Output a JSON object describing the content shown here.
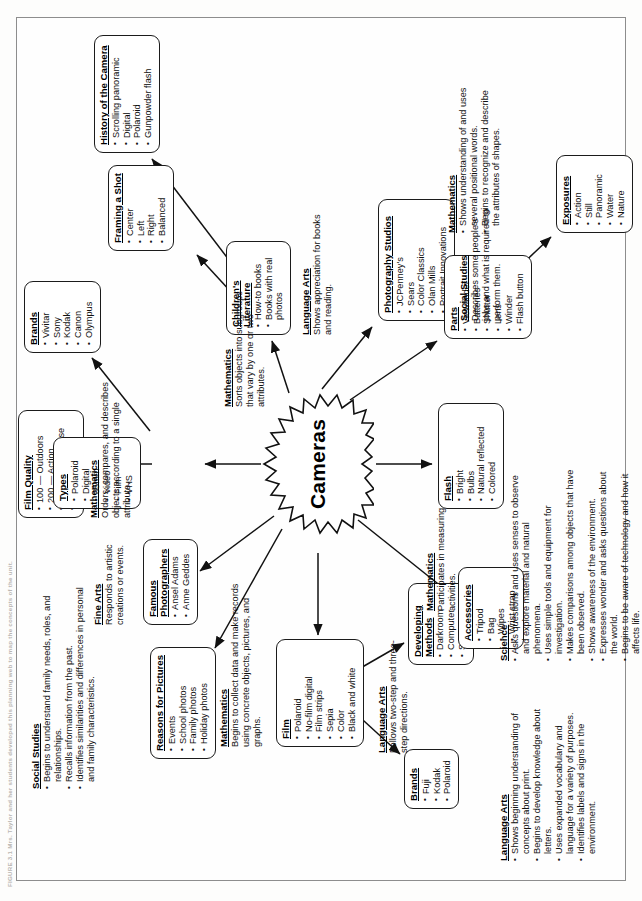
{
  "figure": {
    "caption": "FIGURE 3.1   Mrs. Taylor and her students developed this planning web to map the concepts of the unit."
  },
  "hub": {
    "label": "Cameras"
  },
  "nodes": [
    {
      "id": "reasons-for-pictures",
      "title": "Reasons for Pictures",
      "items": [
        "Events",
        "School photos",
        "Family photos",
        "Holiday photos"
      ]
    },
    {
      "id": "famous-photographers",
      "title": "Famous Photographers",
      "items": [
        "Ansel Adams",
        "Anne Geddes"
      ]
    },
    {
      "id": "film-quality",
      "title": "Film Quality",
      "items": [
        "100 — Outdoors",
        "200 — Action",
        "400 — All purpose",
        "800 — Lowest"
      ]
    },
    {
      "id": "types",
      "title": "Types",
      "items": [
        "Polaroid",
        "Digital",
        "35mm",
        "Video",
        "Film",
        "VHS"
      ]
    },
    {
      "id": "brands-camera",
      "title": "Brands",
      "items": [
        "Vivitar",
        "Sony",
        "Kodak",
        "Canon",
        "Olympus"
      ]
    },
    {
      "id": "framing-a-shot",
      "title": "Framing a Shot",
      "items": [
        "Center",
        "Left",
        "Right",
        "Balanced"
      ]
    },
    {
      "id": "history-of-the-camera",
      "title": "History of the Camera",
      "items": [
        "Scrolling panoramic",
        "Digital",
        "Polaroid",
        "Gunpowder flash"
      ]
    },
    {
      "id": "childrens-literature",
      "title": "Children's Literature",
      "items": [
        "How-to books",
        "Books with real photos"
      ]
    },
    {
      "id": "photography-studios",
      "title": "Photography Studios",
      "items": [
        "JCPenney's",
        "Sears",
        "Color Classics",
        "Olan Mills",
        "Portrait Innovations"
      ]
    },
    {
      "id": "film",
      "title": "Film",
      "items": [
        "Polaroid",
        "No-film digital",
        "Film strips",
        "Sepia",
        "Color",
        "Black and white"
      ]
    },
    {
      "id": "brands-film",
      "title": "Brands",
      "items": [
        "Fuji",
        "Kodak",
        "Polaroid"
      ]
    },
    {
      "id": "developing-methods",
      "title": "Developing Methods",
      "items": [
        "Darkroom",
        "Computer",
        "Store"
      ]
    },
    {
      "id": "accessories",
      "title": "Accessories",
      "items": [
        "Tripod",
        "Bag",
        "Wipes",
        "Wrist strap"
      ]
    },
    {
      "id": "flash",
      "title": "Flash",
      "items": [
        "Bright",
        "Bulbs",
        "Natural reflected",
        "Colored"
      ]
    },
    {
      "id": "parts",
      "title": "Parts",
      "items": [
        "Viewfinder",
        "Batteries",
        "Shutter",
        "Lens",
        "Winder",
        "Flash button"
      ]
    },
    {
      "id": "exposures",
      "title": "Exposures",
      "items": [
        "Action",
        "Still",
        "Panoramic",
        "Water",
        "Nature"
      ]
    }
  ],
  "standards": [
    {
      "id": "social-studies-family",
      "heading": "Social Studies",
      "bullets": [
        "Begins to understand family needs, roles, and relationships.",
        "Recalls information from the past.",
        "Identifies similarities and differences in personal and family characteristics."
      ],
      "body": ""
    },
    {
      "id": "fine-arts",
      "heading": "Fine Arts",
      "bullets": [],
      "body": "Responds to artistic creations or events."
    },
    {
      "id": "mathematics-orders",
      "heading": "Mathematics",
      "bullets": [],
      "body": "Orders, compares, and describes objects according to a single attribute."
    },
    {
      "id": "mathematics-sorts",
      "heading": "Mathematics",
      "bullets": [],
      "body": "Sorts objects into subgroups that vary by one or two attributes."
    },
    {
      "id": "language-arts-appreciation",
      "heading": "Language Arts",
      "bullets": [],
      "body": "Shows appreciation for books and reading."
    },
    {
      "id": "social-studies-jobs",
      "heading": "Social Studies",
      "bullets": [],
      "body": "Describes some people's jobs and what is required to perform them."
    },
    {
      "id": "mathematics-positional",
      "heading": "Mathematics",
      "bullets": [
        "Shows understanding of and uses several positional words.",
        "Begins to recognize and describe the attributes of shapes."
      ],
      "body": ""
    },
    {
      "id": "mathematics-data",
      "heading": "Mathematics",
      "bullets": [],
      "body": "Begins to collect data and make records using concrete objects, pictures, and graphs."
    },
    {
      "id": "language-arts-directions",
      "heading": "Language Arts",
      "bullets": [],
      "body": "Follows two-step and three-step directions."
    },
    {
      "id": "mathematics-measuring",
      "heading": "Mathematics",
      "bullets": [],
      "body": "Participates in measuring activities."
    },
    {
      "id": "language-arts-print",
      "heading": "Language Arts",
      "bullets": [
        "Shows beginning understanding of concepts about print.",
        "Begins to develop knowledge about letters.",
        "Uses expanded vocabulary and language for a variety of purposes.",
        "Identifies labels and signs in the environment."
      ],
      "body": ""
    },
    {
      "id": "science",
      "heading": "Science",
      "bullets": [
        "Asks questions and uses senses to observe and explore material and natural phenomena.",
        "Uses simple tools and equipment for investigation.",
        "Makes comparisons among objects that have been observed.",
        "Shows awareness of the environment.",
        "Expresses wonder and asks questions about the world.",
        "Begins to be aware of technology and how it affects life."
      ],
      "body": ""
    }
  ]
}
